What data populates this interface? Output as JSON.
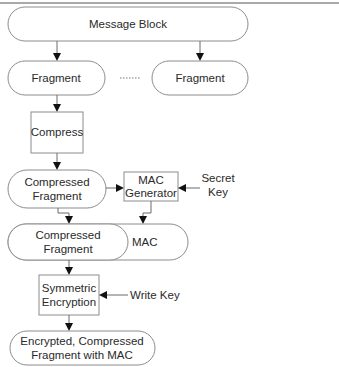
{
  "diagram": {
    "type": "flowchart",
    "nodes": {
      "message_block": {
        "label": "Message Block",
        "shape": "pill"
      },
      "fragment_1": {
        "label": "Fragment",
        "shape": "pill"
      },
      "ellipsis": {
        "label": "······"
      },
      "fragment_2": {
        "label": "Fragment",
        "shape": "pill"
      },
      "compress": {
        "label": "Compress",
        "shape": "box"
      },
      "compressed_fragment": {
        "line1": "Compressed",
        "line2": "Fragment",
        "shape": "pill"
      },
      "mac_generator": {
        "line1": "MAC",
        "line2": "Generator",
        "shape": "box"
      },
      "secret_key": {
        "line1": "Secret",
        "line2": "Key"
      },
      "compressed_fragment_mac": {
        "line1": "Compressed",
        "line2": "Fragment",
        "mac_label": "MAC",
        "shape": "pill"
      },
      "symmetric_encryption": {
        "line1": "Symmetric",
        "line2": "Encryption",
        "shape": "box"
      },
      "write_key": {
        "label": "Write Key"
      },
      "output": {
        "line1": "Encrypted, Compressed",
        "line2": "Fragment with MAC",
        "shape": "pill"
      }
    },
    "edges": [
      {
        "from": "message_block",
        "to": "fragment_1"
      },
      {
        "from": "message_block",
        "to": "fragment_2"
      },
      {
        "from": "fragment_1",
        "to": "compress"
      },
      {
        "from": "compress",
        "to": "compressed_fragment"
      },
      {
        "from": "compressed_fragment",
        "to": "mac_generator"
      },
      {
        "from": "secret_key",
        "to": "mac_generator"
      },
      {
        "from": "compressed_fragment",
        "to": "compressed_fragment_mac"
      },
      {
        "from": "mac_generator",
        "to": "compressed_fragment_mac"
      },
      {
        "from": "compressed_fragment_mac",
        "to": "symmetric_encryption"
      },
      {
        "from": "write_key",
        "to": "symmetric_encryption"
      },
      {
        "from": "symmetric_encryption",
        "to": "output"
      }
    ]
  }
}
